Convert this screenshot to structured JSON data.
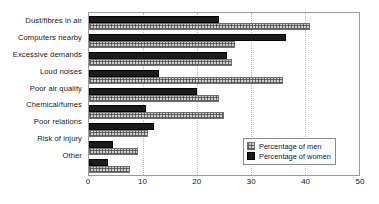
{
  "chart_data": {
    "type": "bar",
    "orientation": "horizontal",
    "title": "",
    "xlabel": "",
    "ylabel": "",
    "xlim": [
      0,
      50
    ],
    "xticks": [
      0,
      10,
      20,
      30,
      40,
      50
    ],
    "grid": true,
    "legend_position": "inside-right",
    "categories": [
      "Dust/fibres in air",
      "Computers nearby",
      "Excessive demands",
      "Loud noises",
      "Poor air quality",
      "Chemical/fumes",
      "Poor relations",
      "Risk of injury",
      "Other"
    ],
    "series": [
      {
        "name": "Percentage of men",
        "color": "#cfcfcf",
        "pattern": "cross-hatch",
        "values": [
          41,
          27,
          26.5,
          36,
          24,
          25,
          11,
          9,
          7.5
        ]
      },
      {
        "name": "Percentage of women",
        "color": "#1b1b1b",
        "pattern": "solid",
        "values": [
          24,
          36.5,
          25.5,
          13,
          20,
          10.5,
          12,
          4.5,
          3.5
        ]
      }
    ]
  },
  "legend": {
    "items": [
      {
        "label": "Percentage of men",
        "style": "men"
      },
      {
        "label": "Percentage of women",
        "style": "women"
      }
    ]
  }
}
